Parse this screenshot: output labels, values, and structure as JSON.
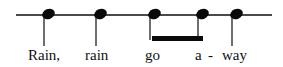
{
  "colors": {
    "staff_line": "#4a4a4a",
    "stem": "#6e6e6e",
    "notehead": "#0a0a0a",
    "beam": "#0a0a0a",
    "lyric_text": "#111111",
    "background": "#ffffff"
  },
  "staff": {
    "line_label": "single horizontal pitch line",
    "x_start": 16,
    "x_end": 272,
    "y": 14,
    "thickness": 1.5
  },
  "notes": [
    {
      "index": 1,
      "lyric": "Rain,",
      "x": 48,
      "head_y": 9,
      "stem_bottom": 46,
      "stem_direction": "down",
      "beamed": false,
      "duration": "quarter"
    },
    {
      "index": 2,
      "lyric": "rain",
      "x": 100,
      "head_y": 9,
      "stem_bottom": 46,
      "stem_direction": "down",
      "beamed": false,
      "duration": "quarter"
    },
    {
      "index": 3,
      "lyric": "go",
      "x": 154,
      "head_y": 9,
      "stem_bottom": 40,
      "stem_direction": "down",
      "beamed": true,
      "duration": "eighth"
    },
    {
      "index": 4,
      "lyric": "a -",
      "x": 202,
      "head_y": 9,
      "stem_bottom": 40,
      "stem_direction": "down",
      "beamed": true,
      "duration": "eighth"
    },
    {
      "index": 5,
      "lyric": "way",
      "x": 236,
      "head_y": 9,
      "stem_bottom": 46,
      "stem_direction": "down",
      "beamed": false,
      "duration": "quarter"
    }
  ],
  "beams": [
    {
      "from_note": 3,
      "to_note": 4,
      "x_start": 152,
      "x_end": 203,
      "y": 36,
      "thickness": 5
    }
  ],
  "lyrics": [
    {
      "text": "Rain,",
      "x": 28,
      "y": 48
    },
    {
      "text": "rain",
      "x": 85,
      "y": 48
    },
    {
      "text": "go",
      "x": 145,
      "y": 48
    },
    {
      "text": "a",
      "x": 195,
      "y": 48
    },
    {
      "text": "-",
      "x": 208,
      "y": 48
    },
    {
      "text": "way",
      "x": 222,
      "y": 48
    }
  ]
}
